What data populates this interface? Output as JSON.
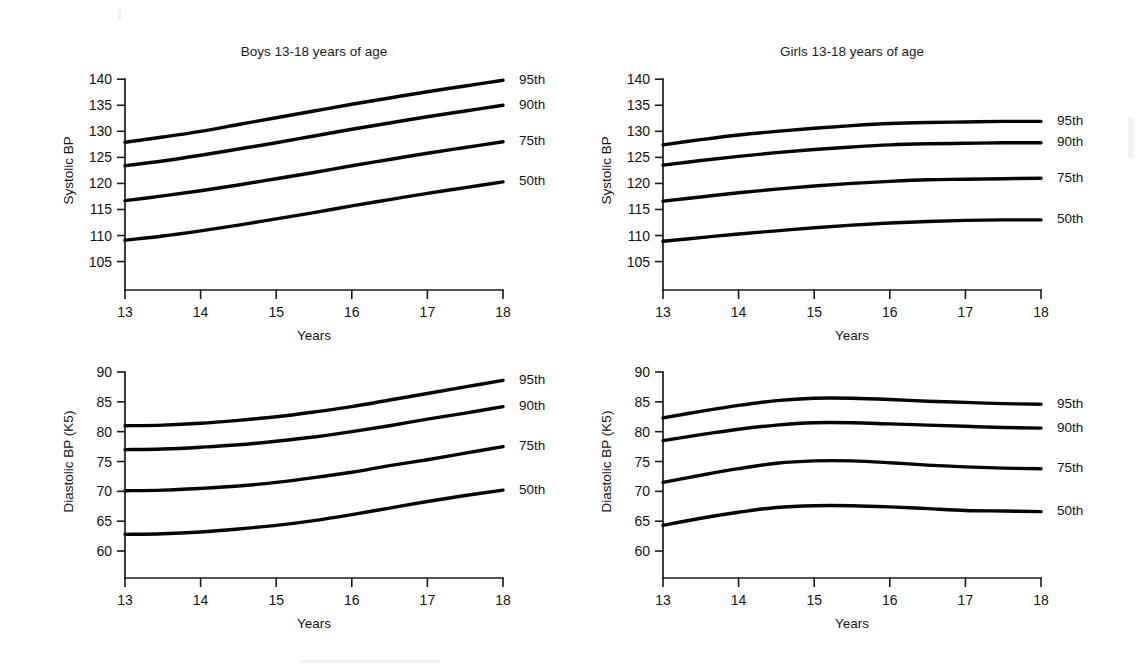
{
  "figure": {
    "background_color": "#ffffff",
    "line_color": "#050505",
    "text_color": "#141414",
    "panel_count": 4
  },
  "panels": [
    {
      "id": "boys-systolic",
      "title": "Boys 13-18 years of age",
      "ylabel": "Systolic BP",
      "xlabel": "Years",
      "yticks": [
        105,
        110,
        115,
        120,
        125,
        130,
        135,
        140
      ],
      "xticks": [
        13,
        14,
        15,
        16,
        17,
        18
      ],
      "percentile_labels": [
        "95th",
        "90th",
        "75th",
        "50th"
      ]
    },
    {
      "id": "girls-systolic",
      "title": "Girls 13-18 years of age",
      "ylabel": "Systolic BP",
      "xlabel": "Years",
      "yticks": [
        105,
        110,
        115,
        120,
        125,
        130,
        135,
        140
      ],
      "xticks": [
        13,
        14,
        15,
        16,
        17,
        18
      ],
      "percentile_labels": [
        "95th",
        "90th",
        "75th",
        "50th"
      ]
    },
    {
      "id": "boys-diastolic",
      "title": "",
      "ylabel": "Diastolic BP (K5)",
      "xlabel": "Years",
      "yticks": [
        60,
        65,
        70,
        75,
        80,
        85,
        90
      ],
      "xticks": [
        13,
        14,
        15,
        16,
        17,
        18
      ],
      "percentile_labels": [
        "95th",
        "90th",
        "75th",
        "50th"
      ]
    },
    {
      "id": "girls-diastolic",
      "title": "",
      "ylabel": "Diastolic BP (K5)",
      "xlabel": "Years",
      "yticks": [
        60,
        65,
        70,
        75,
        80,
        85,
        90
      ],
      "xticks": [
        13,
        14,
        15,
        16,
        17,
        18
      ],
      "percentile_labels": [
        "95th",
        "90th",
        "75th",
        "50th"
      ]
    }
  ],
  "chart_data": [
    {
      "id": "boys-systolic",
      "type": "line",
      "title": "Boys 13-18 years of age",
      "xlabel": "Years",
      "ylabel": "Systolic BP",
      "x": [
        13,
        13.5,
        14,
        14.5,
        15,
        15.5,
        16,
        16.5,
        17,
        17.5,
        18
      ],
      "xlim": [
        13,
        18
      ],
      "ylim": [
        103,
        141
      ],
      "yticks": [
        105,
        110,
        115,
        120,
        125,
        130,
        135,
        140
      ],
      "xticks": [
        13,
        14,
        15,
        16,
        17,
        18
      ],
      "grid": false,
      "legend_position": "right-of-line-ends",
      "series": [
        {
          "name": "95th",
          "values": [
            127.9,
            128.9,
            130.0,
            131.3,
            132.6,
            133.9,
            135.2,
            136.4,
            137.6,
            138.7,
            139.8
          ]
        },
        {
          "name": "90th",
          "values": [
            123.4,
            124.3,
            125.4,
            126.6,
            127.8,
            129.1,
            130.4,
            131.6,
            132.8,
            133.9,
            135.0
          ]
        },
        {
          "name": "75th",
          "values": [
            116.7,
            117.6,
            118.6,
            119.7,
            120.9,
            122.1,
            123.4,
            124.6,
            125.8,
            126.9,
            128.0
          ]
        },
        {
          "name": "50th",
          "values": [
            109.1,
            109.9,
            110.9,
            112.0,
            113.2,
            114.4,
            115.7,
            116.9,
            118.1,
            119.2,
            120.3
          ]
        }
      ]
    },
    {
      "id": "girls-systolic",
      "type": "line",
      "title": "Girls 13-18 years of age",
      "xlabel": "Years",
      "ylabel": "Systolic BP",
      "x": [
        13,
        13.5,
        14,
        14.5,
        15,
        15.5,
        16,
        16.5,
        17,
        17.5,
        18
      ],
      "xlim": [
        13,
        18
      ],
      "ylim": [
        103,
        141
      ],
      "yticks": [
        105,
        110,
        115,
        120,
        125,
        130,
        135,
        140
      ],
      "xticks": [
        13,
        14,
        15,
        16,
        17,
        18
      ],
      "grid": false,
      "legend_position": "right-of-line-ends",
      "series": [
        {
          "name": "95th",
          "values": [
            127.4,
            128.4,
            129.3,
            130.0,
            130.6,
            131.1,
            131.5,
            131.7,
            131.8,
            131.9,
            131.9
          ]
        },
        {
          "name": "90th",
          "values": [
            123.5,
            124.4,
            125.2,
            125.9,
            126.5,
            127.0,
            127.4,
            127.6,
            127.7,
            127.8,
            127.8
          ]
        },
        {
          "name": "75th",
          "values": [
            116.6,
            117.4,
            118.2,
            118.9,
            119.5,
            120.0,
            120.4,
            120.7,
            120.8,
            120.9,
            121.0
          ]
        },
        {
          "name": "50th",
          "values": [
            108.9,
            109.6,
            110.3,
            110.9,
            111.5,
            112.0,
            112.4,
            112.7,
            112.9,
            113.0,
            113.0
          ]
        }
      ]
    },
    {
      "id": "boys-diastolic",
      "type": "line",
      "title": "",
      "xlabel": "Years",
      "ylabel": "Diastolic BP (K5)",
      "x": [
        13,
        13.5,
        14,
        14.5,
        15,
        15.5,
        16,
        16.5,
        17,
        17.5,
        18
      ],
      "xlim": [
        13,
        18
      ],
      "ylim": [
        58.5,
        90.5
      ],
      "yticks": [
        60,
        65,
        70,
        75,
        80,
        85,
        90
      ],
      "xticks": [
        13,
        14,
        15,
        16,
        17,
        18
      ],
      "grid": false,
      "legend_position": "right-of-line-ends",
      "series": [
        {
          "name": "95th",
          "values": [
            81.0,
            81.1,
            81.4,
            81.9,
            82.5,
            83.3,
            84.2,
            85.3,
            86.4,
            87.5,
            88.6
          ]
        },
        {
          "name": "90th",
          "values": [
            77.0,
            77.1,
            77.4,
            77.8,
            78.4,
            79.1,
            80.0,
            81.0,
            82.1,
            83.1,
            84.2
          ]
        },
        {
          "name": "75th",
          "values": [
            70.1,
            70.2,
            70.5,
            70.9,
            71.5,
            72.3,
            73.2,
            74.3,
            75.3,
            76.4,
            77.5
          ]
        },
        {
          "name": "50th",
          "values": [
            62.8,
            62.9,
            63.2,
            63.7,
            64.3,
            65.1,
            66.1,
            67.2,
            68.3,
            69.3,
            70.2
          ]
        }
      ]
    },
    {
      "id": "girls-diastolic",
      "type": "line",
      "title": "",
      "xlabel": "Years",
      "ylabel": "Diastolic BP (K5)",
      "x": [
        13,
        13.5,
        14,
        14.5,
        15,
        15.5,
        16,
        16.5,
        17,
        17.5,
        18
      ],
      "xlim": [
        13,
        18
      ],
      "ylim": [
        58.5,
        90.5
      ],
      "yticks": [
        60,
        65,
        70,
        75,
        80,
        85,
        90
      ],
      "xticks": [
        13,
        14,
        15,
        16,
        17,
        18
      ],
      "grid": false,
      "legend_position": "right-of-line-ends",
      "series": [
        {
          "name": "95th",
          "values": [
            82.3,
            83.4,
            84.4,
            85.2,
            85.6,
            85.6,
            85.4,
            85.1,
            84.9,
            84.7,
            84.6
          ]
        },
        {
          "name": "90th",
          "values": [
            78.5,
            79.5,
            80.4,
            81.1,
            81.5,
            81.5,
            81.3,
            81.1,
            80.9,
            80.7,
            80.6
          ]
        },
        {
          "name": "75th",
          "values": [
            71.5,
            72.7,
            73.8,
            74.7,
            75.1,
            75.1,
            74.8,
            74.4,
            74.1,
            73.9,
            73.8
          ]
        },
        {
          "name": "50th",
          "values": [
            64.3,
            65.5,
            66.5,
            67.3,
            67.6,
            67.6,
            67.4,
            67.1,
            66.8,
            66.7,
            66.6
          ]
        }
      ]
    }
  ]
}
